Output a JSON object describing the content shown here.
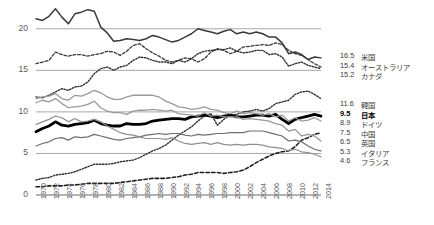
{
  "chart_data": {
    "type": "line",
    "title": "",
    "xlabel": "",
    "ylabel": "",
    "xlim": [
      1970,
      2014
    ],
    "ylim": [
      0,
      22.5
    ],
    "yticks": [
      0,
      5,
      10,
      15,
      20
    ],
    "grid": true,
    "legend_position": "right-endpoints",
    "x": [
      1970,
      1971,
      1972,
      1973,
      1974,
      1975,
      1976,
      1977,
      1978,
      1979,
      1980,
      1981,
      1982,
      1983,
      1984,
      1985,
      1986,
      1987,
      1988,
      1989,
      1990,
      1991,
      1992,
      1993,
      1994,
      1995,
      1996,
      1997,
      1998,
      1999,
      2000,
      2001,
      2002,
      2003,
      2004,
      2005,
      2006,
      2007,
      2008,
      2009,
      2010,
      2011,
      2012,
      2013,
      2014
    ],
    "xticks": [
      "1970",
      "1972",
      "1974",
      "1976",
      "1978",
      "1980",
      "1982",
      "1984",
      "1986",
      "1988",
      "1990",
      "1992",
      "1994",
      "1996",
      "1998",
      "2000",
      "2002",
      "2004",
      "2006",
      "2008",
      "2010",
      "2012",
      "2014"
    ],
    "series": [
      {
        "name": "米国",
        "end_value": "16.5",
        "style": "solid",
        "color": "#3a3a3a",
        "width": 1.5,
        "values": [
          21.2,
          21.0,
          21.5,
          22.4,
          21.4,
          20.6,
          21.8,
          22.0,
          22.3,
          22.1,
          20.2,
          19.5,
          18.5,
          18.6,
          18.8,
          18.7,
          18.6,
          18.8,
          19.2,
          19.0,
          18.7,
          18.4,
          18.6,
          19.0,
          19.4,
          20.0,
          19.8,
          19.6,
          19.4,
          19.7,
          19.9,
          19.4,
          19.6,
          19.4,
          19.6,
          19.4,
          19.0,
          19.0,
          18.3,
          17.0,
          17.2,
          16.9,
          16.3,
          16.6,
          16.5
        ]
      },
      {
        "name": "オーストラリア",
        "end_value": "15.4",
        "style": "dashed",
        "color": "#3a3a3a",
        "width": 1.3,
        "values": [
          15.8,
          16.0,
          16.2,
          17.2,
          16.9,
          16.7,
          16.9,
          16.9,
          16.7,
          16.9,
          17.0,
          17.3,
          17.2,
          16.8,
          17.3,
          18.0,
          18.2,
          17.6,
          17.1,
          16.7,
          16.2,
          16.0,
          16.2,
          16.5,
          16.4,
          16.0,
          16.4,
          17.2,
          17.6,
          17.4,
          17.0,
          17.3,
          17.8,
          17.9,
          18.0,
          18.1,
          18.0,
          18.3,
          18.1,
          17.4,
          17.0,
          16.8,
          16.3,
          15.8,
          15.4
        ]
      },
      {
        "name": "カナダ",
        "end_value": "15.2",
        "style": "dotted",
        "color": "#2f2f2f",
        "width": 1.4,
        "values": [
          11.8,
          11.7,
          12.0,
          12.4,
          12.8,
          12.6,
          13.0,
          13.1,
          13.6,
          14.6,
          15.2,
          15.4,
          15.0,
          15.4,
          15.6,
          16.2,
          16.6,
          16.5,
          16.2,
          16.0,
          16.0,
          15.8,
          16.2,
          16.0,
          16.4,
          17.0,
          17.3,
          17.4,
          17.5,
          17.5,
          17.7,
          17.3,
          17.1,
          17.2,
          17.4,
          17.4,
          16.9,
          17.0,
          16.6,
          15.5,
          15.8,
          16.0,
          15.6,
          15.4,
          15.2
        ]
      },
      {
        "name": "韓国",
        "end_value": "11.6",
        "style": "dotted",
        "color": "#2f2f2f",
        "width": 1.4,
        "values": [
          1.8,
          2.0,
          2.1,
          2.4,
          2.5,
          2.6,
          2.8,
          3.1,
          3.4,
          3.7,
          3.7,
          3.7,
          3.8,
          4.0,
          4.1,
          4.2,
          4.5,
          4.9,
          5.3,
          5.6,
          6.0,
          6.6,
          7.2,
          7.7,
          8.2,
          8.9,
          9.5,
          9.8,
          8.4,
          9.1,
          9.6,
          9.7,
          10.0,
          10.1,
          10.3,
          10.1,
          10.4,
          11.0,
          11.2,
          11.4,
          12.1,
          12.4,
          12.5,
          12.1,
          11.6
        ]
      },
      {
        "name": "日本",
        "end_value": "9.5",
        "style": "solid",
        "color": "#000000",
        "width": 2.8,
        "values": [
          7.6,
          8.0,
          8.3,
          8.8,
          8.4,
          8.3,
          8.5,
          8.6,
          8.7,
          9.0,
          8.6,
          8.4,
          8.3,
          8.3,
          8.6,
          8.5,
          8.5,
          8.6,
          8.9,
          9.0,
          9.1,
          9.2,
          9.2,
          9.1,
          9.4,
          9.5,
          9.6,
          9.5,
          9.3,
          9.5,
          9.6,
          9.4,
          9.4,
          9.5,
          9.6,
          9.6,
          9.5,
          9.7,
          9.1,
          8.6,
          9.1,
          9.3,
          9.5,
          9.7,
          9.5
        ]
      },
      {
        "name": "ドイツ",
        "end_value": "8.9",
        "style": "solid",
        "color": "#9a9a9a",
        "width": 1.3,
        "values": [
          11.6,
          11.8,
          11.9,
          12.2,
          11.6,
          11.4,
          12.0,
          11.9,
          12.2,
          12.6,
          12.3,
          11.8,
          11.5,
          11.5,
          11.8,
          12.0,
          12.0,
          12.0,
          12.0,
          11.8,
          11.3,
          11.0,
          10.6,
          10.5,
          10.3,
          10.4,
          10.6,
          10.3,
          10.2,
          9.9,
          9.8,
          10.1,
          9.8,
          9.9,
          9.8,
          9.6,
          9.8,
          9.4,
          9.6,
          8.9,
          9.3,
          8.9,
          9.0,
          9.3,
          8.9
        ]
      },
      {
        "name": "中国",
        "end_value": "7.5",
        "style": "dashed",
        "color": "#1f1f1f",
        "width": 1.6,
        "values": [
          1.0,
          1.0,
          1.1,
          1.1,
          1.1,
          1.2,
          1.2,
          1.3,
          1.4,
          1.4,
          1.4,
          1.4,
          1.4,
          1.5,
          1.6,
          1.7,
          1.8,
          1.9,
          2.0,
          2.0,
          2.0,
          2.1,
          2.2,
          2.4,
          2.5,
          2.7,
          2.7,
          2.7,
          2.7,
          2.6,
          2.7,
          2.8,
          3.0,
          3.4,
          3.9,
          4.3,
          4.7,
          5.0,
          5.2,
          5.3,
          5.8,
          6.6,
          6.9,
          7.3,
          7.5
        ]
      },
      {
        "name": "英国",
        "end_value": "6.5",
        "style": "solid",
        "color": "#9a9a9a",
        "width": 1.3,
        "values": [
          11.1,
          11.4,
          11.2,
          11.6,
          11.0,
          10.5,
          10.6,
          10.7,
          10.9,
          11.3,
          10.5,
          10.1,
          9.9,
          9.9,
          9.7,
          10.1,
          10.2,
          10.2,
          10.3,
          10.2,
          10.1,
          10.2,
          9.8,
          9.7,
          9.6,
          9.5,
          9.9,
          9.5,
          9.6,
          9.4,
          9.4,
          9.4,
          9.1,
          9.2,
          9.1,
          9.0,
          8.9,
          8.6,
          8.4,
          7.7,
          7.9,
          7.1,
          7.3,
          7.1,
          6.5
        ]
      },
      {
        "name": "イタリア",
        "end_value": "5.3",
        "style": "solid",
        "color": "#6e6e6e",
        "width": 1.2,
        "values": [
          5.9,
          6.2,
          6.4,
          6.8,
          6.9,
          6.6,
          7.0,
          6.9,
          7.0,
          7.3,
          7.1,
          6.9,
          6.7,
          6.6,
          6.8,
          6.9,
          7.0,
          7.2,
          7.3,
          7.4,
          7.3,
          7.4,
          7.4,
          7.2,
          7.1,
          7.3,
          7.2,
          7.3,
          7.4,
          7.4,
          7.5,
          7.5,
          7.5,
          7.7,
          7.7,
          7.7,
          7.5,
          7.3,
          7.1,
          6.5,
          6.6,
          6.4,
          5.9,
          5.5,
          5.3
        ]
      },
      {
        "name": "フランス",
        "end_value": "4.6",
        "style": "solid",
        "color": "#8f8f8f",
        "width": 1.2,
        "values": [
          8.5,
          8.8,
          9.1,
          9.5,
          9.3,
          8.8,
          9.2,
          8.8,
          8.9,
          9.1,
          8.8,
          8.3,
          7.9,
          7.5,
          7.3,
          7.2,
          7.0,
          6.8,
          6.8,
          6.8,
          6.7,
          6.9,
          6.5,
          6.2,
          6.1,
          6.2,
          6.3,
          6.1,
          6.3,
          6.1,
          6.0,
          6.1,
          6.0,
          6.1,
          6.1,
          6.0,
          5.8,
          5.7,
          5.6,
          5.3,
          5.5,
          5.2,
          5.1,
          4.9,
          4.6
        ]
      }
    ]
  },
  "axis": {
    "yticks": [
      "20",
      "15",
      "10",
      "5",
      "0"
    ],
    "xticks": [
      "1970",
      "1972",
      "1974",
      "1976",
      "1978",
      "1980",
      "1982",
      "1984",
      "1986",
      "1988",
      "1990",
      "1992",
      "1994",
      "1996",
      "1998",
      "2000",
      "2002",
      "2004",
      "2006",
      "2008",
      "2010",
      "2012",
      "2014"
    ]
  },
  "legend_top": [
    {
      "value": "16.5",
      "name": "米国"
    },
    {
      "value": "15.4",
      "name": "オーストラリア"
    },
    {
      "value": "15.2",
      "name": "カナダ"
    }
  ],
  "legend_bottom": [
    {
      "value": "11.6",
      "name": "韓国",
      "bold": false
    },
    {
      "value": "9.5",
      "name": "日本",
      "bold": true
    },
    {
      "value": "8.9",
      "name": "ドイツ",
      "bold": false
    },
    {
      "value": "7.5",
      "name": "中国",
      "bold": false
    },
    {
      "value": "6.5",
      "name": "英国",
      "bold": false
    },
    {
      "value": "5.3",
      "name": "イタリア",
      "bold": false
    },
    {
      "value": "4.6",
      "name": "フランス",
      "bold": false
    }
  ]
}
